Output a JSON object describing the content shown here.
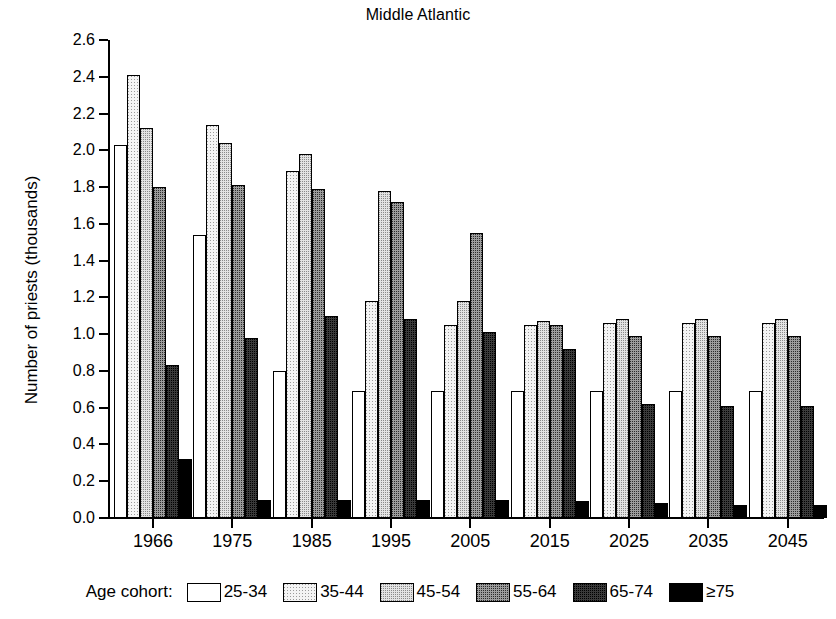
{
  "chart_data": {
    "type": "bar",
    "title": "Middle Atlantic",
    "xlabel": "",
    "ylabel": "Number of priests (thousands)",
    "categories": [
      "1966",
      "1975",
      "1985",
      "1995",
      "2005",
      "2015",
      "2025",
      "2035",
      "2045"
    ],
    "ylim": [
      0.0,
      2.6
    ],
    "ytick_labels": [
      "0.0",
      "0.2",
      "0.4",
      "0.6",
      "0.8",
      "1.0",
      "1.2",
      "1.4",
      "1.6",
      "1.8",
      "2.0",
      "2.2",
      "2.4",
      "2.6"
    ],
    "ytick_values": [
      0.0,
      0.2,
      0.4,
      0.6,
      0.8,
      1.0,
      1.2,
      1.4,
      1.6,
      1.8,
      2.0,
      2.2,
      2.4,
      2.6
    ],
    "grid": false,
    "legend_position": "bottom",
    "legend_title": "Age cohort:",
    "series": [
      {
        "name": "25-34",
        "fill": "white",
        "values": [
          2.03,
          1.54,
          0.8,
          0.69,
          0.69,
          0.69,
          0.69,
          0.69,
          0.69
        ]
      },
      {
        "name": "35-44",
        "fill": "very-light-dot",
        "values": [
          2.41,
          2.14,
          1.89,
          1.18,
          1.05,
          1.05,
          1.06,
          1.06,
          1.06
        ]
      },
      {
        "name": "45-54",
        "fill": "light-dot",
        "values": [
          2.12,
          2.04,
          1.98,
          1.78,
          1.18,
          1.07,
          1.08,
          1.08,
          1.08
        ]
      },
      {
        "name": "55-64",
        "fill": "medium-dot",
        "values": [
          1.8,
          1.81,
          1.79,
          1.72,
          1.55,
          1.05,
          0.99,
          0.99,
          0.99
        ]
      },
      {
        "name": "65-74",
        "fill": "dark-dot",
        "values": [
          0.83,
          0.98,
          1.1,
          1.08,
          1.01,
          0.92,
          0.62,
          0.61,
          0.61
        ]
      },
      {
        "name": "≥75",
        "fill": "black",
        "values": [
          0.32,
          0.1,
          0.1,
          0.1,
          0.1,
          0.09,
          0.08,
          0.07,
          0.07
        ]
      }
    ]
  },
  "colors": {
    "axis": "#000000",
    "background": "#ffffff",
    "series_fills": [
      "#ffffff",
      "#f4f4f4",
      "#e3e3e3",
      "#9c9c9c",
      "#3a3a3a",
      "#000000"
    ]
  }
}
